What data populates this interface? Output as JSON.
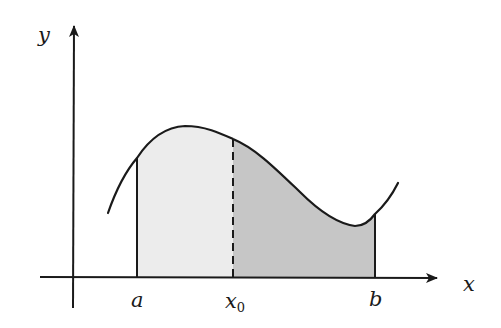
{
  "diagram": {
    "axes": {
      "x_label": "x",
      "y_label": "y"
    },
    "points": {
      "a_label": "a",
      "x0_label": "x",
      "x0_subscript": "0",
      "b_label": "b"
    },
    "regions": [
      {
        "name": "left-region",
        "from": "a",
        "to": "x0",
        "fill": "#ececec"
      },
      {
        "name": "right-region",
        "from": "x0",
        "to": "b",
        "fill": "#c6c6c6"
      }
    ],
    "colors": {
      "stroke": "#1a1a1a",
      "light_fill": "#ececec",
      "dark_fill": "#c6c6c6"
    }
  }
}
